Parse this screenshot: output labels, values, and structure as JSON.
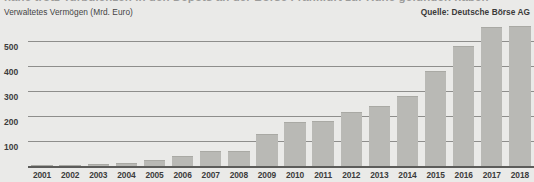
{
  "headline_clipped": "nahe trotz Turbulenzen in den Depots an der Börse Frankfurt zur Ruhe gefunden haben",
  "header": {
    "axis_title": "Verwaltetes Vermögen (Mrd. Euro)",
    "source": "Quelle: Deutsche Börse AG"
  },
  "chart_data": {
    "type": "bar",
    "title": "Verwaltetes Vermögen (Mrd. Euro)",
    "subtitle": "",
    "source": "Quelle: Deutsche Börse AG",
    "xlabel": "",
    "ylabel": "Verwaltetes Vermögen (Mrd. Euro)",
    "unit": "Mrd. Euro",
    "ylim": [
      0,
      580
    ],
    "yticks": [
      100,
      200,
      300,
      400,
      500
    ],
    "ytick_labels": [
      "100",
      "200",
      "300",
      "400",
      "500"
    ],
    "grid": true,
    "legend": "none",
    "bar_color": "#b9b9b5",
    "categories": [
      "2001",
      "2002",
      "2003",
      "2004",
      "2005",
      "2006",
      "2007",
      "2008",
      "2009",
      "2010",
      "2011",
      "2012",
      "2013",
      "2014",
      "2015",
      "2016",
      "2017",
      "2018"
    ],
    "values": [
      4,
      6,
      8,
      12,
      25,
      40,
      60,
      60,
      130,
      175,
      180,
      215,
      240,
      280,
      380,
      480,
      555,
      560
    ]
  },
  "colors": {
    "background": "#eaeae8",
    "bar": "#b9b9b5",
    "gridline": "#8e8e8c",
    "axis": "#5c5c5a",
    "text": "#3c3c3c"
  }
}
